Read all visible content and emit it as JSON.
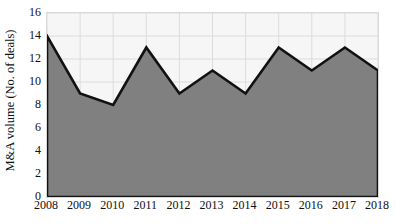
{
  "chart_data": {
    "type": "area",
    "title": "",
    "subtitle": "",
    "xlabel": "",
    "ylabel": "M&A volume (No. of deals)",
    "categories": [
      "2008",
      "2009",
      "2010",
      "2011",
      "2012",
      "2013",
      "2014",
      "2015",
      "2016",
      "2017",
      "2018"
    ],
    "values": [
      14,
      9,
      8,
      13,
      9,
      11,
      9,
      13,
      11,
      13,
      11
    ],
    "series": [
      {
        "name": "M&A volume (No. of deals)",
        "values": [
          14,
          9,
          8,
          13,
          9,
          11,
          9,
          13,
          11,
          13,
          11
        ]
      }
    ],
    "x": [
      2008,
      2009,
      2010,
      2011,
      2012,
      2013,
      2014,
      2015,
      2016,
      2017,
      2018
    ],
    "ylim": [
      0,
      16
    ],
    "ytick_values": [
      16,
      14,
      12,
      10,
      8,
      6,
      4,
      2,
      0
    ],
    "ytick_labels": [
      "16",
      "14",
      "12",
      "10",
      "8",
      "6",
      "4",
      "2",
      "0"
    ],
    "ytick_step": 2,
    "xlim": [
      2008,
      2018
    ],
    "grid": true,
    "grid_x": true,
    "grid_y": true,
    "legend": false,
    "legend_position": "none",
    "annotations": [],
    "colors": {
      "area_fill": "#808080",
      "line_stroke": "#111111",
      "plot_background": "#f6f6f6",
      "grid_line": "#dcdcdc",
      "axis_border": "#d9d9d9",
      "text": "#101010",
      "figure_background": "#ffffff"
    },
    "style": {
      "line_width_px": 2.6,
      "plot_left_px": 46,
      "plot_top_px": 12,
      "plot_width_px": 331,
      "plot_height_px": 184
    }
  }
}
